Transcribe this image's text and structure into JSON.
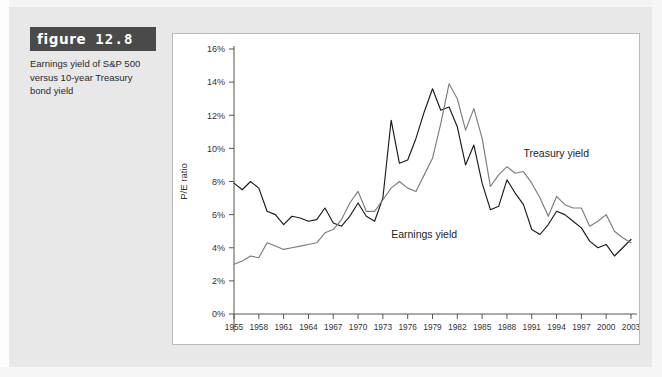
{
  "figure": {
    "label_word": "figure",
    "number": "12.8",
    "caption": "Earnings yield of S&P 500 versus 10-year Treasury bond yield"
  },
  "chart_data": {
    "type": "line",
    "title": "",
    "xlabel": "",
    "ylabel": "P/E ratio",
    "xlim": [
      1955,
      2003
    ],
    "ylim": [
      0,
      16
    ],
    "ytick_labels": [
      "0%",
      "2%",
      "4%",
      "6%",
      "8%",
      "10%",
      "12%",
      "14%",
      "16%"
    ],
    "ytick_values": [
      0,
      2,
      4,
      6,
      8,
      10,
      12,
      14,
      16
    ],
    "xtick_labels": [
      "1955",
      "1958",
      "1961",
      "1964",
      "1967",
      "1970",
      "1973",
      "1976",
      "1979",
      "1982",
      "1985",
      "1988",
      "1991",
      "1994",
      "1997",
      "2000",
      "2003"
    ],
    "xtick_values": [
      1955,
      1958,
      1961,
      1964,
      1967,
      1970,
      1973,
      1976,
      1979,
      1982,
      1985,
      1988,
      1991,
      1994,
      1997,
      2000,
      2003
    ],
    "grid": false,
    "legend_position": "inline-annotation",
    "x": [
      1955,
      1956,
      1957,
      1958,
      1959,
      1960,
      1961,
      1962,
      1963,
      1964,
      1965,
      1966,
      1967,
      1968,
      1969,
      1970,
      1971,
      1972,
      1973,
      1974,
      1975,
      1976,
      1977,
      1978,
      1979,
      1980,
      1981,
      1982,
      1983,
      1984,
      1985,
      1986,
      1987,
      1988,
      1989,
      1990,
      1991,
      1992,
      1993,
      1994,
      1995,
      1996,
      1997,
      1998,
      1999,
      2000,
      2001,
      2002,
      2003
    ],
    "series": [
      {
        "name": "Earnings yield",
        "color": "#1a1a1a",
        "label_x": 1974,
        "label_y": 4.6,
        "values": [
          7.9,
          7.5,
          8.0,
          7.6,
          6.2,
          6.0,
          5.4,
          5.9,
          5.8,
          5.6,
          5.7,
          6.4,
          5.5,
          5.3,
          5.9,
          6.7,
          5.9,
          5.6,
          7.0,
          11.7,
          9.1,
          9.3,
          10.6,
          12.2,
          13.6,
          12.3,
          12.5,
          11.3,
          9.0,
          10.2,
          7.9,
          6.3,
          6.5,
          8.1,
          7.3,
          6.6,
          5.1,
          4.8,
          5.4,
          6.2,
          6.0,
          5.6,
          5.2,
          4.4,
          4.0,
          4.2,
          3.5,
          4.0,
          4.5
        ]
      },
      {
        "name": "Treasury yield",
        "color": "#7c7c7c",
        "label_x": 1990,
        "label_y": 9.5,
        "values": [
          3.0,
          3.2,
          3.5,
          3.4,
          4.3,
          4.1,
          3.9,
          4.0,
          4.1,
          4.2,
          4.3,
          4.9,
          5.1,
          5.7,
          6.7,
          7.4,
          6.2,
          6.2,
          6.9,
          7.6,
          8.0,
          7.6,
          7.4,
          8.4,
          9.4,
          11.5,
          13.9,
          13.0,
          11.1,
          12.4,
          10.6,
          7.7,
          8.4,
          8.9,
          8.5,
          8.6,
          7.9,
          7.0,
          5.9,
          7.1,
          6.6,
          6.4,
          6.4,
          5.3,
          5.6,
          6.0,
          5.0,
          4.6,
          4.3
        ]
      }
    ]
  }
}
